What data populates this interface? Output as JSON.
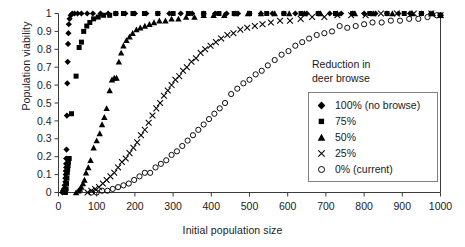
{
  "chart_data": {
    "type": "scatter",
    "title": "",
    "xlabel": "Initial population size",
    "ylabel": "Population viability",
    "xlim": [
      0,
      1000
    ],
    "ylim": [
      0,
      1
    ],
    "xticks": [
      0,
      100,
      200,
      300,
      400,
      500,
      600,
      700,
      800,
      900,
      1000
    ],
    "yticks": [
      0,
      0.1,
      0.2,
      0.3,
      0.4,
      0.5,
      0.6,
      0.7,
      0.8,
      0.9,
      1
    ],
    "xtick_labels": [
      "0",
      "100",
      "200",
      "300",
      "400",
      "500",
      "600",
      "700",
      "800",
      "900",
      "1000"
    ],
    "ytick_labels": [
      "0",
      "0.1",
      "0.2",
      "0.3",
      "0.4",
      "0.5",
      "0.6",
      "0.7",
      "0.8",
      "0.9",
      "1"
    ],
    "grid": false,
    "legend_position": "right",
    "legend_title": "Reduction in deer browse",
    "series": [
      {
        "name": "100% (no browse)",
        "marker": "filled-diamond",
        "color": "#000000",
        "points": [
          [
            10,
            0.0
          ],
          [
            12,
            0.01
          ],
          [
            14,
            0.02
          ],
          [
            16,
            0.04
          ],
          [
            18,
            0.06
          ],
          [
            18,
            0.08
          ],
          [
            19,
            0.1
          ],
          [
            19,
            0.12
          ],
          [
            20,
            0.14
          ],
          [
            20,
            0.16
          ],
          [
            20,
            0.19
          ],
          [
            21,
            0.24
          ],
          [
            22,
            0.43
          ],
          [
            23,
            0.61
          ],
          [
            24,
            0.73
          ],
          [
            25,
            0.83
          ],
          [
            26,
            0.89
          ],
          [
            27,
            0.94
          ],
          [
            29,
            0.97
          ],
          [
            32,
            0.99
          ],
          [
            36,
            1.0
          ],
          [
            42,
            1.0
          ],
          [
            50,
            1.0
          ],
          [
            60,
            1.0
          ],
          [
            75,
            1.0
          ],
          [
            90,
            1.0
          ],
          [
            110,
            1.0
          ],
          [
            130,
            1.0
          ],
          [
            150,
            1.0
          ],
          [
            175,
            1.0
          ],
          [
            200,
            1.0
          ],
          [
            230,
            1.0
          ],
          [
            260,
            1.0
          ],
          [
            290,
            1.0
          ],
          [
            320,
            1.0
          ],
          [
            350,
            1.0
          ],
          [
            380,
            1.0
          ],
          [
            410,
            1.0
          ],
          [
            440,
            1.0
          ],
          [
            470,
            1.0
          ],
          [
            500,
            1.0
          ],
          [
            530,
            1.0
          ],
          [
            560,
            1.0
          ],
          [
            590,
            1.0
          ],
          [
            620,
            1.0
          ],
          [
            650,
            1.0
          ],
          [
            680,
            1.0
          ],
          [
            710,
            1.0
          ],
          [
            740,
            1.0
          ],
          [
            770,
            1.0
          ],
          [
            800,
            1.0
          ],
          [
            830,
            1.0
          ],
          [
            860,
            1.0
          ],
          [
            890,
            1.0
          ],
          [
            920,
            1.0
          ],
          [
            950,
            1.0
          ],
          [
            975,
            1.0
          ],
          [
            1000,
            0.99
          ]
        ]
      },
      {
        "name": "75%",
        "marker": "filled-square",
        "color": "#000000",
        "points": [
          [
            18,
            0.0
          ],
          [
            20,
            0.02
          ],
          [
            21,
            0.05
          ],
          [
            22,
            0.08
          ],
          [
            23,
            0.11
          ],
          [
            24,
            0.13
          ],
          [
            25,
            0.15
          ],
          [
            26,
            0.17
          ],
          [
            28,
            0.19
          ],
          [
            34,
            0.44
          ],
          [
            46,
            0.65
          ],
          [
            54,
            0.81
          ],
          [
            60,
            0.84
          ],
          [
            66,
            0.9
          ],
          [
            74,
            0.93
          ],
          [
            82,
            0.95
          ],
          [
            92,
            0.97
          ],
          [
            104,
            0.98
          ],
          [
            118,
            0.99
          ],
          [
            134,
            0.99
          ],
          [
            150,
            1.0
          ],
          [
            170,
            1.0
          ],
          [
            195,
            1.0
          ],
          [
            225,
            1.0
          ],
          [
            260,
            1.0
          ],
          [
            300,
            1.0
          ],
          [
            340,
            1.0
          ],
          [
            380,
            1.0
          ],
          [
            420,
            1.0
          ],
          [
            460,
            1.0
          ],
          [
            500,
            1.0
          ],
          [
            545,
            1.0
          ],
          [
            590,
            1.0
          ],
          [
            635,
            1.0
          ],
          [
            680,
            1.0
          ],
          [
            725,
            1.0
          ],
          [
            770,
            1.0
          ],
          [
            815,
            1.0
          ],
          [
            860,
            1.0
          ],
          [
            905,
            1.0
          ],
          [
            950,
            1.0
          ],
          [
            1000,
            0.99
          ]
        ]
      },
      {
        "name": "50%",
        "marker": "filled-triangle",
        "color": "#000000",
        "points": [
          [
            46,
            0.0
          ],
          [
            52,
            0.01
          ],
          [
            56,
            0.02
          ],
          [
            60,
            0.03
          ],
          [
            64,
            0.05
          ],
          [
            68,
            0.07
          ],
          [
            72,
            0.11
          ],
          [
            78,
            0.14
          ],
          [
            84,
            0.18
          ],
          [
            92,
            0.25
          ],
          [
            100,
            0.29
          ],
          [
            108,
            0.33
          ],
          [
            114,
            0.38
          ],
          [
            120,
            0.42
          ],
          [
            126,
            0.47
          ],
          [
            134,
            0.57
          ],
          [
            140,
            0.63
          ],
          [
            146,
            0.64
          ],
          [
            152,
            0.64
          ],
          [
            158,
            0.73
          ],
          [
            164,
            0.78
          ],
          [
            170,
            0.82
          ],
          [
            178,
            0.85
          ],
          [
            186,
            0.87
          ],
          [
            194,
            0.89
          ],
          [
            204,
            0.91
          ],
          [
            214,
            0.92
          ],
          [
            226,
            0.93
          ],
          [
            238,
            0.94
          ],
          [
            250,
            0.95
          ],
          [
            264,
            0.96
          ],
          [
            280,
            0.96
          ],
          [
            296,
            0.97
          ],
          [
            314,
            0.97
          ],
          [
            334,
            0.98
          ],
          [
            356,
            0.98
          ],
          [
            380,
            0.99
          ],
          [
            406,
            0.99
          ],
          [
            434,
            0.99
          ],
          [
            464,
            1.0
          ],
          [
            496,
            1.0
          ],
          [
            530,
            1.0
          ],
          [
            566,
            1.0
          ],
          [
            604,
            1.0
          ],
          [
            644,
            1.0
          ],
          [
            686,
            1.0
          ],
          [
            730,
            1.0
          ],
          [
            776,
            1.0
          ],
          [
            824,
            1.0
          ],
          [
            874,
            1.0
          ],
          [
            926,
            1.0
          ],
          [
            980,
            1.0
          ],
          [
            1000,
            0.99
          ]
        ]
      },
      {
        "name": "25%",
        "marker": "cross-x",
        "color": "#000000",
        "points": [
          [
            76,
            0.0
          ],
          [
            86,
            0.01
          ],
          [
            96,
            0.02
          ],
          [
            106,
            0.03
          ],
          [
            116,
            0.05
          ],
          [
            126,
            0.07
          ],
          [
            136,
            0.09
          ],
          [
            146,
            0.11
          ],
          [
            156,
            0.14
          ],
          [
            166,
            0.17
          ],
          [
            176,
            0.19
          ],
          [
            186,
            0.22
          ],
          [
            196,
            0.25
          ],
          [
            206,
            0.28
          ],
          [
            216,
            0.32
          ],
          [
            226,
            0.35
          ],
          [
            236,
            0.39
          ],
          [
            246,
            0.43
          ],
          [
            256,
            0.47
          ],
          [
            266,
            0.5
          ],
          [
            276,
            0.54
          ],
          [
            286,
            0.57
          ],
          [
            296,
            0.6
          ],
          [
            306,
            0.63
          ],
          [
            316,
            0.65
          ],
          [
            326,
            0.68
          ],
          [
            336,
            0.7
          ],
          [
            348,
            0.73
          ],
          [
            360,
            0.75
          ],
          [
            372,
            0.78
          ],
          [
            384,
            0.8
          ],
          [
            398,
            0.82
          ],
          [
            412,
            0.84
          ],
          [
            426,
            0.86
          ],
          [
            442,
            0.88
          ],
          [
            458,
            0.89
          ],
          [
            476,
            0.91
          ],
          [
            494,
            0.92
          ],
          [
            514,
            0.93
          ],
          [
            534,
            0.94
          ],
          [
            556,
            0.95
          ],
          [
            580,
            0.96
          ],
          [
            606,
            0.96
          ],
          [
            634,
            0.97
          ],
          [
            664,
            0.98
          ],
          [
            696,
            0.98
          ],
          [
            730,
            0.99
          ],
          [
            766,
            0.99
          ],
          [
            804,
            0.99
          ],
          [
            844,
            1.0
          ],
          [
            886,
            1.0
          ],
          [
            930,
            1.0
          ],
          [
            976,
            1.0
          ],
          [
            1000,
            0.99
          ]
        ]
      },
      {
        "name": "0% (current)",
        "marker": "open-circle",
        "color": "#000000",
        "points": [
          [
            86,
            0.0
          ],
          [
            100,
            0.0
          ],
          [
            114,
            0.01
          ],
          [
            128,
            0.01
          ],
          [
            142,
            0.02
          ],
          [
            156,
            0.03
          ],
          [
            170,
            0.04
          ],
          [
            184,
            0.05
          ],
          [
            198,
            0.07
          ],
          [
            212,
            0.09
          ],
          [
            226,
            0.11
          ],
          [
            240,
            0.11
          ],
          [
            254,
            0.14
          ],
          [
            268,
            0.16
          ],
          [
            282,
            0.18
          ],
          [
            296,
            0.21
          ],
          [
            310,
            0.23
          ],
          [
            324,
            0.26
          ],
          [
            338,
            0.29
          ],
          [
            352,
            0.32
          ],
          [
            366,
            0.35
          ],
          [
            380,
            0.38
          ],
          [
            394,
            0.41
          ],
          [
            408,
            0.44
          ],
          [
            422,
            0.47
          ],
          [
            436,
            0.5
          ],
          [
            452,
            0.55
          ],
          [
            468,
            0.58
          ],
          [
            484,
            0.61
          ],
          [
            500,
            0.63
          ],
          [
            516,
            0.66
          ],
          [
            532,
            0.68
          ],
          [
            548,
            0.71
          ],
          [
            566,
            0.74
          ],
          [
            584,
            0.77
          ],
          [
            602,
            0.79
          ],
          [
            620,
            0.82
          ],
          [
            638,
            0.84
          ],
          [
            656,
            0.86
          ],
          [
            676,
            0.88
          ],
          [
            696,
            0.89
          ],
          [
            716,
            0.9
          ],
          [
            736,
            0.93
          ],
          [
            756,
            0.92
          ],
          [
            778,
            0.93
          ],
          [
            800,
            0.94
          ],
          [
            822,
            0.95
          ],
          [
            846,
            0.95
          ],
          [
            870,
            0.96
          ],
          [
            894,
            0.96
          ],
          [
            918,
            0.97
          ],
          [
            942,
            0.97
          ],
          [
            966,
            0.98
          ],
          [
            990,
            0.99
          ],
          [
            1000,
            0.99
          ]
        ]
      }
    ]
  },
  "legend": {
    "title_line1": "Reduction in",
    "title_line2": "deer browse",
    "items": [
      {
        "label": "100% (no browse)",
        "marker": "filled-diamond"
      },
      {
        "label": "75%",
        "marker": "filled-square"
      },
      {
        "label": "50%",
        "marker": "filled-triangle"
      },
      {
        "label": "25%",
        "marker": "cross-x"
      },
      {
        "label": "0% (current)",
        "marker": "open-circle"
      }
    ]
  },
  "axes": {
    "x_title": "Initial population size",
    "y_title": "Population viability"
  }
}
